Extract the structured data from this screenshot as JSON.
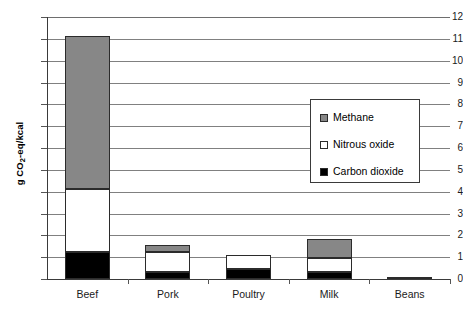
{
  "chart_data": {
    "type": "bar",
    "stacked": true,
    "title": "",
    "xlabel": "",
    "ylabel": "g CO2-eq/kcal",
    "ylabel_parts": {
      "prefix": "g CO",
      "sub": "2",
      "suffix": "-eq/kcal"
    },
    "categories": [
      "Beef",
      "Pork",
      "Poultry",
      "Milk",
      "Beans"
    ],
    "ylim": [
      0,
      12
    ],
    "yticks": [
      0,
      1,
      2,
      3,
      4,
      5,
      6,
      7,
      8,
      9,
      10,
      11,
      12
    ],
    "ytick_labels": [
      "0",
      "1",
      "2",
      "3",
      "4",
      "5",
      "6",
      "7",
      "8",
      "9",
      "10",
      "11",
      "12"
    ],
    "grid": true,
    "grid_axis": "y",
    "legend_position": "center-right",
    "series": [
      {
        "name": "Carbon dioxide",
        "color": "#000000",
        "values": [
          1.25,
          0.3,
          0.45,
          0.3,
          0.07
        ]
      },
      {
        "name": "Nitrous oxide",
        "color": "#ffffff",
        "values": [
          2.85,
          0.95,
          0.65,
          0.65,
          0.02
        ]
      },
      {
        "name": "Methane",
        "color": "#878787",
        "values": [
          7.05,
          0.3,
          0.0,
          0.9,
          0.01
        ]
      }
    ],
    "totals": [
      11.15,
      1.55,
      1.1,
      1.85,
      0.1
    ]
  },
  "legend": {
    "items": [
      {
        "label": "Methane",
        "swatch": "methane"
      },
      {
        "label": "Nitrous oxide",
        "swatch": "nitrous"
      },
      {
        "label": "Carbon dioxide",
        "swatch": "carbon"
      }
    ]
  }
}
